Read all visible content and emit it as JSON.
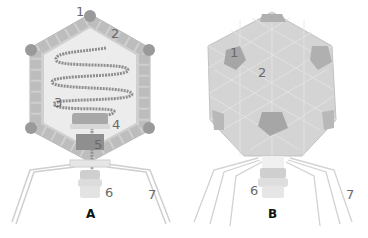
{
  "diagram": {
    "panels": [
      {
        "id": "A",
        "label": "A",
        "view": "cross-section"
      },
      {
        "id": "B",
        "label": "B",
        "view": "exterior"
      }
    ],
    "labels_a": [
      {
        "n": "1"
      },
      {
        "n": "2"
      },
      {
        "n": "3"
      },
      {
        "n": "4"
      },
      {
        "n": "5"
      },
      {
        "n": "6"
      },
      {
        "n": "7"
      }
    ],
    "labels_b": [
      {
        "n": "1"
      },
      {
        "n": "2"
      },
      {
        "n": "6"
      },
      {
        "n": "7"
      }
    ],
    "colors": {
      "capsomer": "#c8c8c8",
      "penton": "#9a9a9a",
      "interior": "#ededed",
      "dna": "#8a8a8a",
      "outline": "#b0b0b0"
    }
  }
}
